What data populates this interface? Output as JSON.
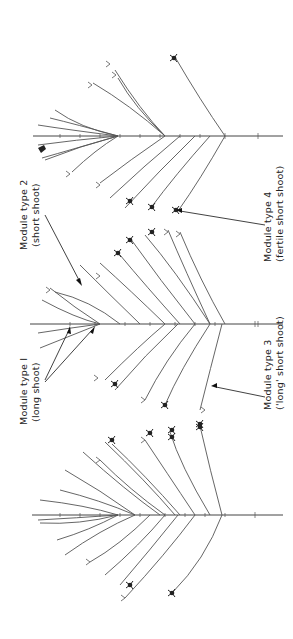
{
  "figure": {
    "labels": [
      {
        "id": "module-type-2",
        "line1": "Module type 2",
        "line2": "(short shoot)"
      },
      {
        "id": "module-type-1",
        "line1": "Module type I",
        "line2": "(long shoot)"
      },
      {
        "id": "module-type-4",
        "line1": "Module type 4",
        "line2": "(fertile short shoot)"
      },
      {
        "id": "module-type-3",
        "line1": "Module type 3",
        "line2": "('long' short shoot)"
      }
    ],
    "trees": [
      {
        "id": "tree-1",
        "axis_y": 136
      },
      {
        "id": "tree-2",
        "axis_y": 324
      },
      {
        "id": "tree-3",
        "axis_y": 515
      }
    ],
    "colors": {
      "line": "#555555",
      "text": "#222222",
      "background": "#ffffff"
    }
  }
}
